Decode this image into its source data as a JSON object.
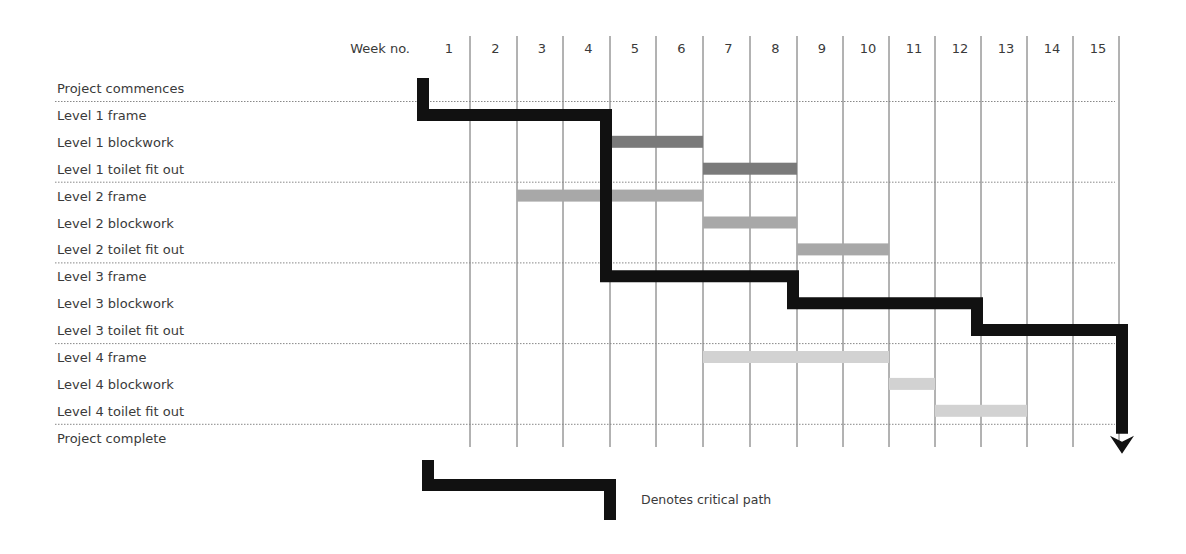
{
  "chart_data": {
    "type": "gantt",
    "title": "",
    "header_label": "Week no.",
    "weeks": [
      1,
      2,
      3,
      4,
      5,
      6,
      7,
      8,
      9,
      10,
      11,
      12,
      13,
      14,
      15
    ],
    "tasks": [
      {
        "name": "Project commences",
        "start": null,
        "end": null,
        "shade": null
      },
      {
        "name": "Level 1 frame",
        "start": 1,
        "end": 4,
        "shade": "critical"
      },
      {
        "name": "Level 1 blockwork",
        "start": 5,
        "end": 6,
        "shade": "dark"
      },
      {
        "name": "Level 1 toilet fit out",
        "start": 7,
        "end": 8,
        "shade": "dark"
      },
      {
        "name": "Level 2 frame",
        "start": 3,
        "end": 6,
        "shade": "medium"
      },
      {
        "name": "Level 2 blockwork",
        "start": 7,
        "end": 8,
        "shade": "medium"
      },
      {
        "name": "Level 2 toilet fit out",
        "start": 9,
        "end": 10,
        "shade": "medium"
      },
      {
        "name": "Level 3 frame",
        "start": 5,
        "end": 8,
        "shade": "critical"
      },
      {
        "name": "Level 3 blockwork",
        "start": 9,
        "end": 12,
        "shade": "critical"
      },
      {
        "name": "Level 3 toilet fit out",
        "start": 13,
        "end": 15,
        "shade": "critical"
      },
      {
        "name": "Level 4 frame",
        "start": 7,
        "end": 10,
        "shade": "light"
      },
      {
        "name": "Level 4 blockwork",
        "start": 11,
        "end": 11,
        "shade": "light"
      },
      {
        "name": "Level 4 toilet fit out",
        "start": 12,
        "end": 13,
        "shade": "light"
      },
      {
        "name": "Project complete",
        "start": null,
        "end": null,
        "shade": null
      }
    ],
    "critical_path": [
      "Level 1 frame",
      "Level 3 frame",
      "Level 3 blockwork",
      "Level 3 toilet fit out",
      "Project complete"
    ],
    "legend": [
      {
        "symbol": "critical-path-line",
        "label": "Denotes critical path"
      }
    ],
    "colors": {
      "critical": "#111111",
      "dark": "#7a7a7a",
      "medium": "#a8a8a8",
      "light": "#d2d2d2",
      "grid": "#666666",
      "divider": "#888888"
    },
    "grid": true,
    "legend_position": "bottom"
  },
  "legend": {
    "label": "Denotes critical path"
  }
}
